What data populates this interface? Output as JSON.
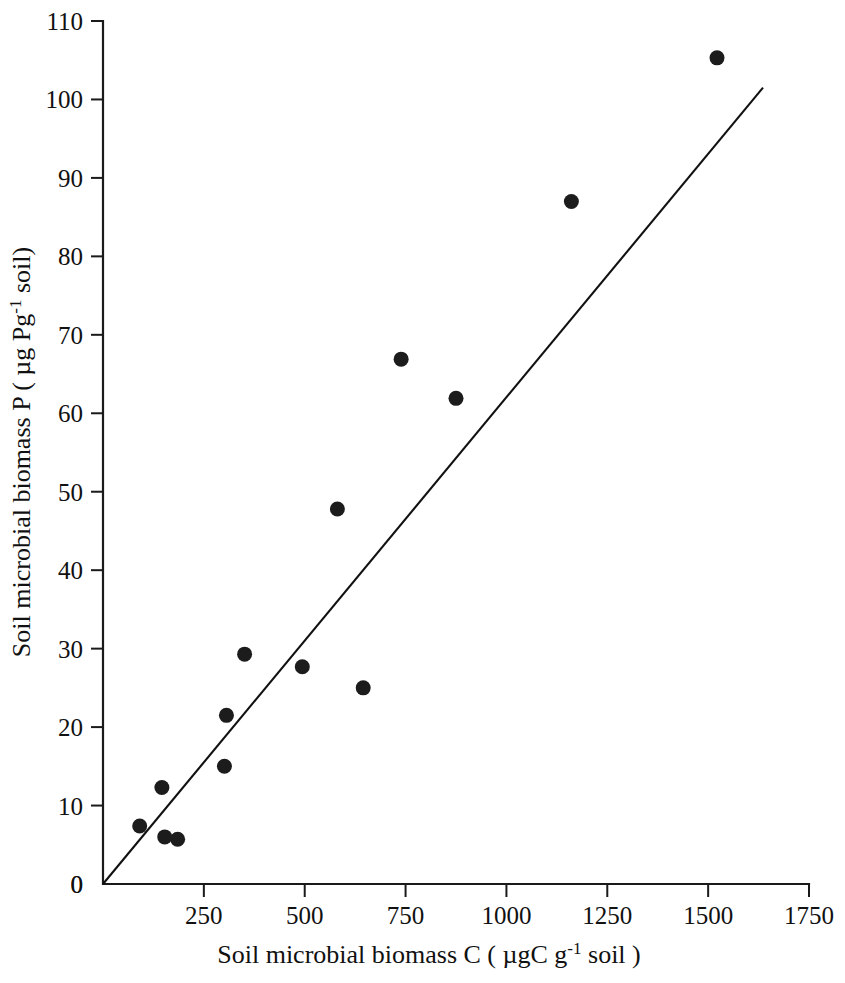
{
  "chart_data": {
    "type": "scatter",
    "title": "",
    "xlabel": "Soil microbial biomass C ( µgC g-1 soil )",
    "ylabel": "Soil microbial biomass P ( µg Pg-1 soil)",
    "xlabel_parts": {
      "pre": "Soil microbial biomass C ( µgC g",
      "sup": "-1",
      "post": " soil )"
    },
    "ylabel_parts": {
      "pre": "Soil microbial biomass P ( µg Pg",
      "sup": "-1",
      "post": " soil)"
    },
    "xlim": [
      0,
      1750
    ],
    "ylim": [
      0,
      110
    ],
    "xticks": [
      0,
      250,
      500,
      750,
      1000,
      1250,
      1500,
      1750
    ],
    "yticks": [
      0,
      10,
      20,
      30,
      40,
      50,
      60,
      70,
      80,
      90,
      100,
      110
    ],
    "xtick_labels": [
      "0",
      "250",
      "500",
      "750",
      "1000",
      "1250",
      "1500",
      "1750"
    ],
    "ytick_labels": [
      "0",
      "10",
      "20",
      "30",
      "40",
      "50",
      "60",
      "70",
      "80",
      "90",
      "100",
      "110"
    ],
    "grid": false,
    "legend": null,
    "marker_color": "#1c1c1c",
    "line_color": "#111111",
    "axis_color": "#1a1a1a",
    "marker_shape": "filled-circle",
    "marker_radius": 7.5,
    "points": [
      {
        "x": 91,
        "y": 7.4
      },
      {
        "x": 146,
        "y": 12.3
      },
      {
        "x": 153,
        "y": 6.0
      },
      {
        "x": 185,
        "y": 5.7
      },
      {
        "x": 301,
        "y": 15.0
      },
      {
        "x": 306,
        "y": 21.5
      },
      {
        "x": 351,
        "y": 29.3
      },
      {
        "x": 494,
        "y": 27.7
      },
      {
        "x": 581,
        "y": 47.8
      },
      {
        "x": 645,
        "y": 25.0
      },
      {
        "x": 739,
        "y": 66.9
      },
      {
        "x": 875,
        "y": 61.9
      },
      {
        "x": 1161,
        "y": 87.0
      },
      {
        "x": 1522,
        "y": 105.3
      }
    ],
    "fit_line": {
      "type": "linear-through-origin",
      "x_start": 0,
      "y_start": 0,
      "x_end": 1636,
      "y_end": 101.5
    }
  }
}
